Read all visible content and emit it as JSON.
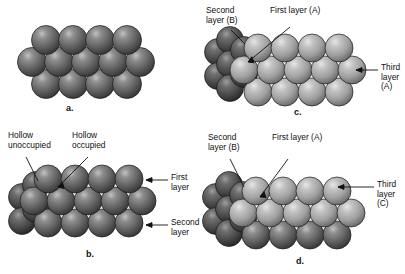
{
  "figure": {
    "background": "#ffffff",
    "width": 405,
    "height": 274
  },
  "colors": {
    "sphere_dark_base": "#6d6d6d",
    "sphere_dark_edge": "#2b2b2b",
    "sphere_dark_highlight": "#b9b9b9",
    "sphere_light_base": "#a8a8a8",
    "sphere_light_edge": "#5d5d5d",
    "sphere_light_highlight": "#e2e2e2",
    "sphere_back_base": "#565656",
    "sphere_back_edge": "#1f1f1f",
    "outline": "#1a1a1a",
    "text": "#101010",
    "leader": "#111111"
  },
  "panels": [
    {
      "id": "a",
      "letter": "a.",
      "description": "Single close-packed layer of spheres viewed from above",
      "labels": []
    },
    {
      "id": "b",
      "letter": "b.",
      "description": "Two stacked close-packed layers showing occupied and unoccupied hollows",
      "labels": [
        {
          "name": "hollow-unoccupied",
          "text": "Hollow\nunoccupied"
        },
        {
          "name": "hollow-occupied",
          "text": "Hollow\noccupied"
        },
        {
          "name": "first-layer",
          "text": "First\nlayer"
        },
        {
          "name": "second-layer",
          "text": "Second\nlayer"
        }
      ]
    },
    {
      "id": "c",
      "letter": "c.",
      "description": "Hexagonal close packing, ABA stacking sequence",
      "labels": [
        {
          "name": "second-layer-b",
          "text": "Second\nlayer (B)"
        },
        {
          "name": "first-layer-a",
          "text": "First layer (A)"
        },
        {
          "name": "third-layer-a",
          "text": "Third\nlayer (A)"
        }
      ]
    },
    {
      "id": "d",
      "letter": "d.",
      "description": "Cubic close packing, ABC stacking sequence",
      "labels": [
        {
          "name": "second-layer-b",
          "text": "Second\nlayer (B)"
        },
        {
          "name": "first-layer-a",
          "text": "First layer (A)"
        },
        {
          "name": "third-layer-c",
          "text": "Third\nlayer (C)"
        }
      ]
    }
  ]
}
